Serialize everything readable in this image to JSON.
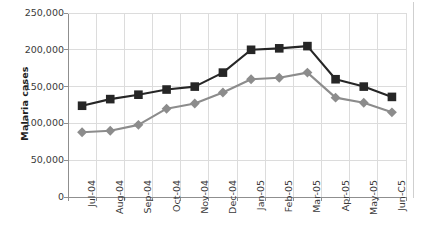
{
  "chart_data": {
    "type": "line",
    "title": "",
    "subtitle": "",
    "xlabel": "",
    "ylabel": "Malaria cases",
    "categories": [
      "Jul-04",
      "Aug-04",
      "Sep-04",
      "Oct-04",
      "Nov-04",
      "Dec-04",
      "Jan-05",
      "Feb-05",
      "Mar-05",
      "Apr-05",
      "May-05",
      "Jun-C5"
    ],
    "series": [
      {
        "name": "dark-square-series",
        "marker": "square",
        "color": "#262626",
        "values": [
          124000,
          133000,
          139000,
          146000,
          150000,
          169000,
          200000,
          202000,
          205000,
          160000,
          150000,
          136000
        ]
      },
      {
        "name": "gray-diamond-series",
        "marker": "diamond",
        "color": "#8c8c8c",
        "values": [
          88000,
          90000,
          98000,
          120000,
          127000,
          142000,
          160000,
          162000,
          169000,
          135000,
          128000,
          115000
        ]
      }
    ],
    "ylim": [
      0,
      250000
    ],
    "ytick_values": [
      0,
      50000,
      100000,
      150000,
      200000,
      250000
    ],
    "ytick_labels": [
      "0",
      "50,000",
      "100,000",
      "150,000",
      "200,000",
      "250,000"
    ],
    "grid": true,
    "grid_axis": "both",
    "grid_color": "#dcdcdc",
    "legend": false,
    "legend_position": "none",
    "axis_color": "#8f8f8f",
    "background": "#ffffff"
  }
}
